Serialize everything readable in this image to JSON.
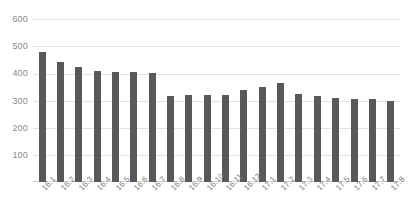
{
  "chart_data": {
    "type": "bar",
    "title": "",
    "subtitle": "",
    "xlabel": "",
    "ylabel": "",
    "categories": [
      "16.1",
      "16.2",
      "16.3",
      "16.4",
      "16.5",
      "16.6",
      "16.7",
      "16.8",
      "16.9",
      "16.10",
      "16.11",
      "16.12",
      "17.1",
      "17.2",
      "17.3",
      "17.4",
      "17.5",
      "17.6",
      "17.7",
      "17.8"
    ],
    "values": [
      480,
      440,
      425,
      410,
      405,
      405,
      400,
      315,
      320,
      320,
      320,
      340,
      350,
      365,
      325,
      315,
      310,
      305,
      305,
      300
    ],
    "series": [
      {
        "name": "",
        "values": [
          480,
          440,
          425,
          410,
          405,
          405,
          400,
          315,
          320,
          320,
          320,
          340,
          350,
          365,
          325,
          315,
          310,
          305,
          305,
          300
        ]
      }
    ],
    "ylim": [
      0,
      600
    ],
    "yticks": [
      0,
      100,
      200,
      300,
      400,
      500,
      600
    ],
    "ytick_labels": [
      "",
      "100",
      "200",
      "300",
      "400",
      "500",
      "600"
    ],
    "grid": true,
    "legend": false,
    "legend_position": "none",
    "bar_color": "#595959",
    "gridline_color": "#e2e2e2",
    "axis_text_color": "#8a8a8a"
  }
}
